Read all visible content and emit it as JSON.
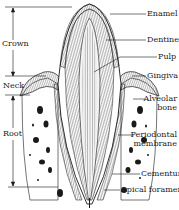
{
  "diagram": {
    "left_labels": {
      "crown": "Crown",
      "neck": "Neck",
      "root": "Root"
    },
    "right_labels": {
      "enamel": "Enamel",
      "dentine": "Dentine",
      "pulp": "Pulp",
      "gingiva": "Gingiva",
      "alveolar_bone_line1": "Alveolar",
      "alveolar_bone_line2": "bone",
      "periodontal_line1": "Periodontal",
      "periodontal_line2": "membrane",
      "cementum": "Cementum",
      "apical_foramen": "Apical foramen"
    },
    "colors": {
      "ink": "#1a1a1a",
      "background": "#ffffff"
    }
  }
}
